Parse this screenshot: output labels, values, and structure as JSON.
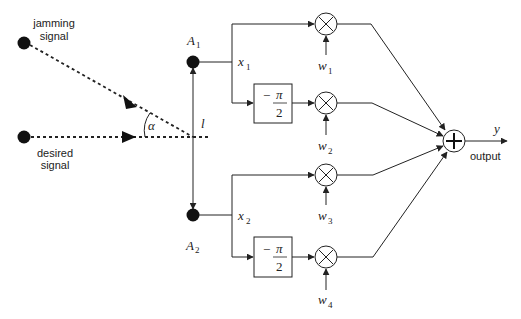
{
  "diagram": {
    "sources": {
      "jamming": {
        "label_line1": "jamming",
        "label_line2": "signal"
      },
      "desired": {
        "label_line1": "desired",
        "label_line2": "signal"
      }
    },
    "angle_label": "α",
    "spacing_label": "l",
    "antennas": [
      {
        "name": "A",
        "sub": "1"
      },
      {
        "name": "A",
        "sub": "2"
      }
    ],
    "element_signals": [
      {
        "name": "x",
        "sub": "1"
      },
      {
        "name": "x",
        "sub": "2"
      }
    ],
    "phase_shift": {
      "sign": "−",
      "numerator": "π",
      "denominator": "2"
    },
    "weights": [
      {
        "name": "w",
        "sub": "1"
      },
      {
        "name": "w",
        "sub": "2"
      },
      {
        "name": "w",
        "sub": "3"
      },
      {
        "name": "w",
        "sub": "4"
      }
    ],
    "multiplier_symbol": "×",
    "summer_symbol": "+",
    "output": {
      "symbol": "y",
      "label": "output"
    },
    "colors": {
      "line": "#222222",
      "background": "#ffffff"
    }
  }
}
